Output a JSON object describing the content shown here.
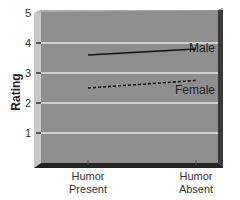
{
  "chart_data": {
    "type": "line",
    "title": "",
    "xlabel": "",
    "ylabel": "Rating",
    "ylim": [
      0,
      5
    ],
    "yticks": [
      1,
      2,
      3,
      4,
      5
    ],
    "grid": true,
    "legend_position": "inline-right",
    "categories": [
      "Humor Present",
      "Humor Absent"
    ],
    "category_lines": [
      [
        "Humor",
        "Present"
      ],
      [
        "Humor",
        "Absent"
      ]
    ],
    "series": [
      {
        "name": "Male",
        "style": "solid",
        "values": [
          3.6,
          3.8
        ]
      },
      {
        "name": "Female",
        "style": "dashed",
        "values": [
          2.5,
          2.75
        ]
      }
    ]
  },
  "colors": {
    "plot_face": "#8c8c8c",
    "plot_wall": "#c4c4c4",
    "floor": "#2a2a2a",
    "grid": "#e6e6e6",
    "line": "#111111"
  }
}
